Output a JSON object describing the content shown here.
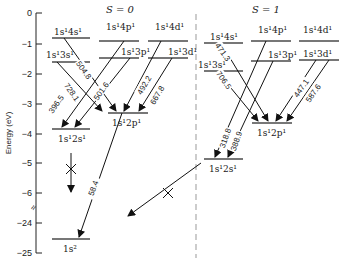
{
  "axis": {
    "title": "Energy (eV)",
    "ticks": [
      {
        "label": "0",
        "y": 13
      },
      {
        "label": "−1",
        "y": 44
      },
      {
        "label": "−2",
        "y": 74
      },
      {
        "label": "−3",
        "y": 104
      },
      {
        "label": "−4",
        "y": 134
      },
      {
        "label": "−5",
        "y": 163
      },
      {
        "label": "−6",
        "y": 193
      },
      {
        "label": "−24",
        "y": 223
      },
      {
        "label": "−25",
        "y": 253
      }
    ],
    "break_symbol": "≈"
  },
  "groups": {
    "singlet": {
      "label": "S = 0"
    },
    "triplet": {
      "label": "S = 1"
    }
  },
  "levels": [
    {
      "id": "s0_4s",
      "label": "1s¹4s¹",
      "x1": 52,
      "x2": 90,
      "y": 38,
      "lx": 54,
      "ly": 35
    },
    {
      "id": "s0_3s",
      "label": "1s¹3s¹",
      "x1": 52,
      "x2": 90,
      "y": 62,
      "lx": 46,
      "ly": 58
    },
    {
      "id": "s0_4p",
      "label": "1s¹4p¹",
      "x1": 99,
      "x2": 139,
      "y": 41,
      "lx": 106,
      "ly": 30
    },
    {
      "id": "s0_3p",
      "label": "1s¹3p¹",
      "x1": 99,
      "x2": 139,
      "y": 58,
      "lx": 121,
      "ly": 55
    },
    {
      "id": "s0_4d",
      "label": "1s¹4d¹",
      "x1": 148,
      "x2": 188,
      "y": 41,
      "lx": 155,
      "ly": 30
    },
    {
      "id": "s0_3d",
      "label": "1s¹3d¹",
      "x1": 148,
      "x2": 188,
      "y": 58,
      "lx": 168,
      "ly": 55
    },
    {
      "id": "s0_2p",
      "label": "1s¹2p¹",
      "x1": 108,
      "x2": 148,
      "y": 113,
      "lx": 112,
      "ly": 126
    },
    {
      "id": "s0_2s",
      "label": "1s¹2s¹",
      "x1": 52,
      "x2": 90,
      "y": 129,
      "lx": 58,
      "ly": 142
    },
    {
      "id": "s0_1s",
      "label": "1s²",
      "x1": 52,
      "x2": 90,
      "y": 239,
      "lx": 63,
      "ly": 252
    },
    {
      "id": "t1_4s",
      "label": "1s¹4s¹",
      "x1": 204,
      "x2": 243,
      "y": 43,
      "lx": 210,
      "ly": 40
    },
    {
      "id": "t1_3s",
      "label": "1s¹3s¹",
      "x1": 204,
      "x2": 243,
      "y": 71,
      "lx": 198,
      "ly": 68
    },
    {
      "id": "t1_4p",
      "label": "1s¹4p¹",
      "x1": 251,
      "x2": 291,
      "y": 41,
      "lx": 258,
      "ly": 33
    },
    {
      "id": "t1_3p",
      "label": "1s¹3p¹",
      "x1": 251,
      "x2": 291,
      "y": 61,
      "lx": 268,
      "ly": 58
    },
    {
      "id": "t1_4d",
      "label": "1s¹4d¹",
      "x1": 299,
      "x2": 339,
      "y": 41,
      "lx": 303,
      "ly": 33
    },
    {
      "id": "t1_3d",
      "label": "1s¹3d¹",
      "x1": 299,
      "x2": 339,
      "y": 60,
      "lx": 303,
      "ly": 57
    },
    {
      "id": "t1_2p",
      "label": "1s¹2p¹",
      "x1": 252,
      "x2": 292,
      "y": 123,
      "lx": 257,
      "ly": 136
    },
    {
      "id": "t1_2s",
      "label": "1s¹2s¹",
      "x1": 204,
      "x2": 243,
      "y": 159,
      "lx": 209,
      "ly": 172
    }
  ],
  "transitions": [
    {
      "nm": "504.8",
      "x1": 64,
      "y1": 38,
      "x2": 116,
      "y2": 111,
      "tx": 84,
      "ty": 70,
      "rot": 55
    },
    {
      "nm": "728.1",
      "x1": 57,
      "y1": 62,
      "x2": 102,
      "y2": 111,
      "tx": 72,
      "ty": 92,
      "rot": 55
    },
    {
      "nm": "396.5",
      "x1": 124,
      "y1": 41,
      "x2": 62,
      "y2": 127,
      "tx": 56,
      "ty": 104,
      "rot": -55
    },
    {
      "nm": "501.6",
      "x1": 130,
      "y1": 58,
      "x2": 75,
      "y2": 127,
      "tx": 101,
      "ty": 91,
      "rot": -55
    },
    {
      "nm": "492.2",
      "x1": 161,
      "y1": 41,
      "x2": 124,
      "y2": 111,
      "tx": 144,
      "ty": 85,
      "rot": -60
    },
    {
      "nm": "667.8",
      "x1": 172,
      "y1": 58,
      "x2": 139,
      "y2": 111,
      "tx": 157,
      "ty": 95,
      "rot": -60
    },
    {
      "nm": "58.4",
      "x1": 122,
      "y1": 113,
      "x2": 79,
      "y2": 237,
      "tx": 93,
      "ty": 188,
      "rot": -70
    },
    {
      "nm": "471.3",
      "x1": 221,
      "y1": 43,
      "x2": 268,
      "y2": 121,
      "tx": 223,
      "ty": 52,
      "rot": 55
    },
    {
      "nm": "706.5",
      "x1": 217,
      "y1": 71,
      "x2": 258,
      "y2": 121,
      "tx": 224,
      "ty": 80,
      "rot": 55
    },
    {
      "nm": "318.8",
      "x1": 266,
      "y1": 41,
      "x2": 215,
      "y2": 157,
      "tx": 225,
      "ty": 138,
      "rot": -70
    },
    {
      "nm": "388.9",
      "x1": 273,
      "y1": 61,
      "x2": 228,
      "y2": 157,
      "tx": 236,
      "ty": 141,
      "rot": -70
    },
    {
      "nm": "447.1",
      "x1": 316,
      "y1": 60,
      "x2": 276,
      "y2": 121,
      "tx": 301,
      "ty": 88,
      "rot": -55
    },
    {
      "nm": "587.6",
      "x1": 329,
      "y1": 60,
      "x2": 287,
      "y2": 121,
      "tx": 313,
      "ty": 93,
      "rot": -55
    }
  ],
  "forbidden": [
    {
      "id": "singlet_2s_to_ground",
      "x1": 71,
      "y1": 153,
      "x2": 71,
      "y2": 192,
      "cx": 71,
      "cy": 169
    },
    {
      "id": "triplet_2s_to_ground",
      "x1": 201,
      "y1": 163,
      "x2": 128,
      "y2": 216,
      "cx": 168,
      "cy": 193
    }
  ],
  "divider": {
    "x": 196,
    "y1": 14,
    "y2": 258
  }
}
